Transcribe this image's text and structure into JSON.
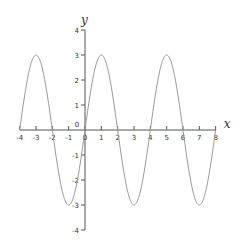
{
  "chart_data": {
    "type": "line",
    "title": "",
    "xlabel": "x",
    "ylabel": "y",
    "xlim": [
      -4,
      8
    ],
    "ylim": [
      -4,
      4
    ],
    "grid": false,
    "legend": null,
    "x_ticks": [
      -4,
      -3,
      -2,
      -1,
      0,
      1,
      2,
      3,
      4,
      5,
      6,
      7,
      8
    ],
    "y_ticks": [
      -4,
      -3,
      -2,
      -1,
      1,
      2,
      3,
      4
    ],
    "origin_label": "0",
    "series": [
      {
        "name": "y = 3 sin(πx/2)",
        "color": "#999999",
        "x": [
          -4,
          -3,
          -2,
          -1,
          0,
          1,
          2,
          3,
          4,
          5,
          6,
          7,
          8
        ],
        "values": [
          0,
          3,
          0,
          -3,
          0,
          3,
          0,
          -3,
          0,
          3,
          0,
          -3,
          0
        ]
      }
    ]
  },
  "colors": {
    "axis": "#555555",
    "curve": "#999999"
  }
}
